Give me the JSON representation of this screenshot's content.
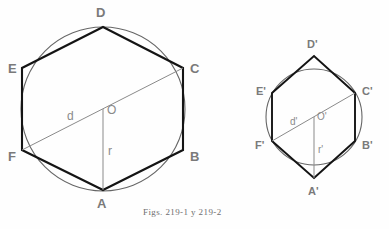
{
  "figure": {
    "caption": "Figs. 219-1 y 219-2",
    "background_color": "#fefefe",
    "stroke_color_hexagon": "#1a1a1a",
    "stroke_color_circle": "#555555",
    "stroke_color_measure": "#8a8a8a",
    "label_color": "#7a7a7a"
  },
  "figure_left": {
    "name": "Fig. 219-1",
    "circle": {
      "cx": 103,
      "cy": 109,
      "r": 82
    },
    "vertices": [
      {
        "id": "A",
        "label": "A",
        "x": 103,
        "y": 190,
        "label_x": 97,
        "label_y": 197
      },
      {
        "id": "B",
        "label": "B",
        "x": 183,
        "y": 150,
        "label_x": 190,
        "label_y": 150
      },
      {
        "id": "C",
        "label": "C",
        "x": 183,
        "y": 68,
        "label_x": 190,
        "label_y": 62
      },
      {
        "id": "D",
        "label": "D",
        "x": 103,
        "y": 27,
        "label_x": 96,
        "label_y": 6
      },
      {
        "id": "E",
        "label": "E",
        "x": 22,
        "y": 68,
        "label_x": 8,
        "label_y": 62
      },
      {
        "id": "F",
        "label": "F",
        "x": 22,
        "y": 150,
        "label_x": 8,
        "label_y": 150
      }
    ],
    "center": {
      "id": "O",
      "label": "O",
      "x": 103,
      "y": 109,
      "label_x": 107,
      "label_y": 104
    },
    "diagonal": {
      "id": "d",
      "label": "d",
      "from": "F",
      "to": "C",
      "label_x": 67,
      "label_y": 110
    },
    "radius": {
      "id": "r",
      "label": "r",
      "from": "O",
      "to": "A",
      "label_x": 108,
      "label_y": 145
    }
  },
  "figure_right": {
    "name": "Fig. 219-2",
    "circle": {
      "cx": 314,
      "cy": 117,
      "r": 48
    },
    "vertices": [
      {
        "id": "A1",
        "label": "A'",
        "x": 314,
        "y": 178,
        "label_x": 308,
        "label_y": 186
      },
      {
        "id": "B1",
        "label": "B'",
        "x": 355,
        "y": 141,
        "label_x": 362,
        "label_y": 140
      },
      {
        "id": "C1",
        "label": "C'",
        "x": 355,
        "y": 93,
        "label_x": 362,
        "label_y": 86
      },
      {
        "id": "D1",
        "label": "D'",
        "x": 314,
        "y": 56,
        "label_x": 307,
        "label_y": 39
      },
      {
        "id": "E1",
        "label": "E'",
        "x": 272,
        "y": 93,
        "label_x": 256,
        "label_y": 86
      },
      {
        "id": "F1",
        "label": "F'",
        "x": 272,
        "y": 141,
        "label_x": 255,
        "label_y": 140
      }
    ],
    "center": {
      "id": "O1",
      "label": "O'",
      "x": 314,
      "y": 117,
      "label_x": 317,
      "label_y": 112
    },
    "diagonal": {
      "id": "d1",
      "label": "d'",
      "from": "F'",
      "to": "C'",
      "label_x": 290,
      "label_y": 117
    },
    "radius": {
      "id": "r1",
      "label": "r'",
      "from": "O'",
      "to": "A'",
      "label_x": 318,
      "label_y": 145
    },
    "caption_x": 143,
    "caption_y": 208
  }
}
